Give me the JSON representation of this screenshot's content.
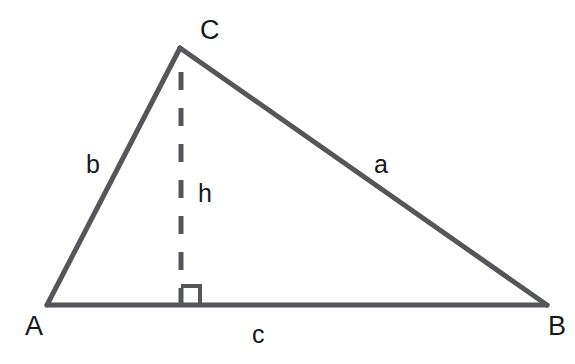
{
  "diagram": {
    "type": "triangle-with-altitude",
    "background_color": "#ffffff",
    "stroke_color": "#55565a",
    "label_color": "#16181a",
    "vertices": {
      "A": {
        "label": "A",
        "x": 47,
        "y": 305
      },
      "B": {
        "label": "B",
        "x": 547,
        "y": 305
      },
      "C": {
        "label": "C",
        "x": 180,
        "y": 48
      }
    },
    "sides": {
      "a": {
        "label": "a",
        "from": "B",
        "to": "C"
      },
      "b": {
        "label": "b",
        "from": "A",
        "to": "C"
      },
      "c": {
        "label": "c",
        "from": "A",
        "to": "B"
      }
    },
    "altitude": {
      "label": "h",
      "from_vertex": "C",
      "foot_x": 181,
      "foot_y": 305,
      "top_y": 72,
      "style": "dashed",
      "dash_on": 18,
      "dash_off": 18,
      "width": 5
    },
    "right_angle_marker": {
      "present": true,
      "size": 19,
      "x": 181,
      "y": 305
    },
    "stroke_widths": {
      "triangle": 5,
      "altitude": 5,
      "right_angle": 4
    }
  }
}
